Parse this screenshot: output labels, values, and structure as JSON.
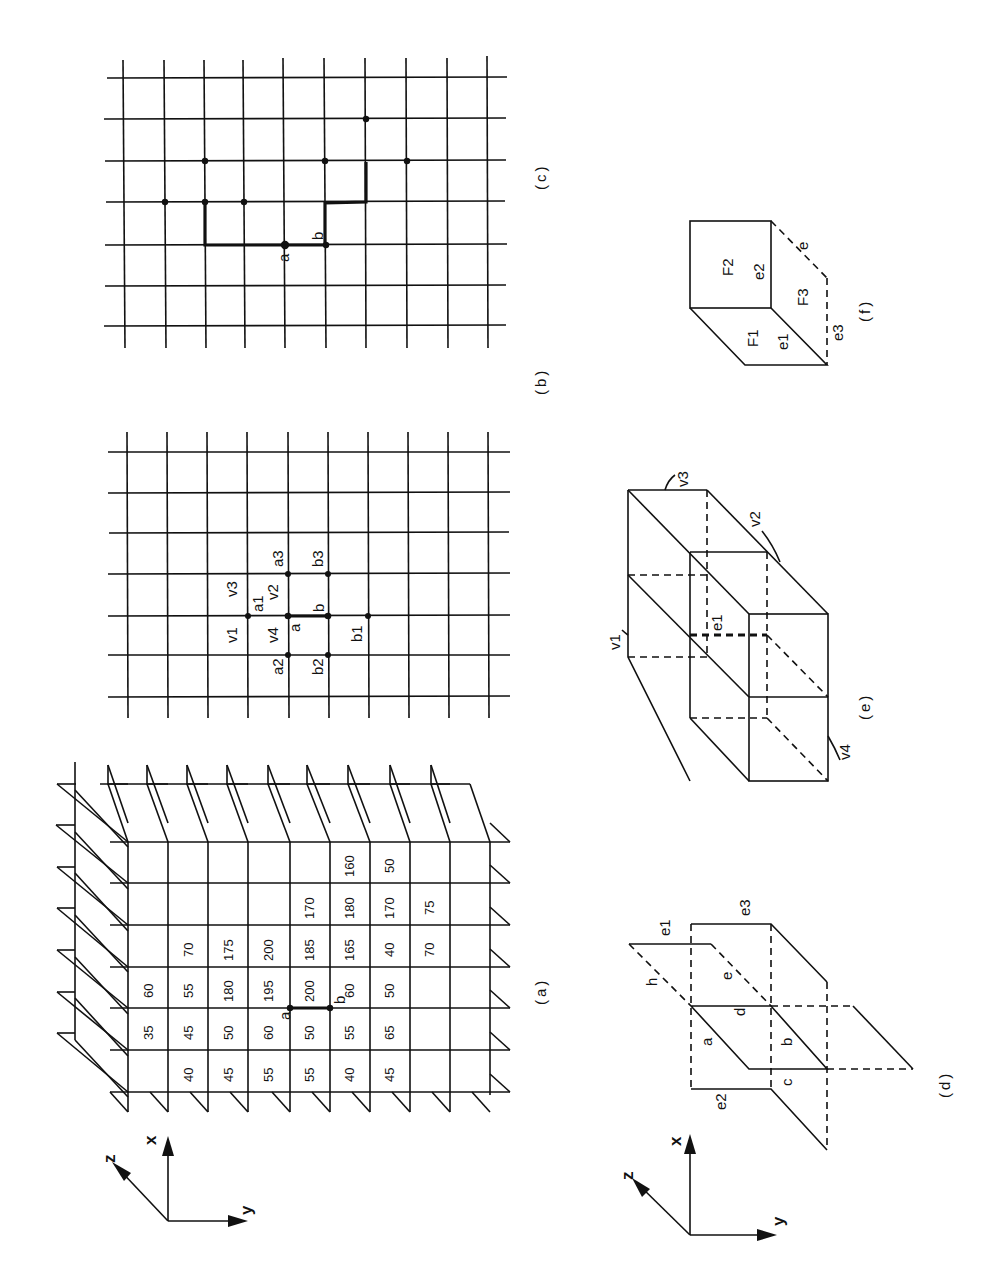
{
  "figure": {
    "orientation": "rotated-90-ccw",
    "panels": {
      "a": {
        "caption": "(a)",
        "description": "3D stack of planar grids with cell values",
        "edge_labels": [
          "a",
          "b"
        ],
        "cell_values_by_screen_column": [
          {
            "col": 1,
            "values": [
              "60",
              "35",
              ""
            ]
          },
          {
            "col": 2,
            "values": [
              "70",
              "55",
              "45",
              "40"
            ]
          },
          {
            "col": 3,
            "values": [
              "175",
              "180",
              "50",
              "45"
            ]
          },
          {
            "col": 4,
            "values": [
              "200",
              "195",
              "60",
              "55"
            ]
          },
          {
            "col": 5,
            "values": [
              "170",
              "185",
              "200",
              "50",
              "55"
            ]
          },
          {
            "col": 6,
            "values": [
              "160",
              "180",
              "165",
              "60",
              "55",
              "40"
            ]
          },
          {
            "col": 7,
            "values": [
              "50",
              "170",
              "40",
              "50",
              "65",
              "45"
            ]
          },
          {
            "col": 8,
            "values": [
              "75",
              "70"
            ]
          }
        ]
      },
      "b": {
        "caption": "(b)",
        "labels": [
          "v3",
          "a1",
          "v2",
          "a3",
          "b3",
          "v1",
          "v4",
          "a",
          "b",
          "b1",
          "a2",
          "b2"
        ]
      },
      "c": {
        "caption": "(c)",
        "labels": [
          "a",
          "b"
        ]
      },
      "d": {
        "caption": "(d)",
        "labels": [
          "e1",
          "e3",
          "h",
          "e",
          "d",
          "a",
          "b",
          "c",
          "e2"
        ]
      },
      "e": {
        "caption": "(e)",
        "labels": [
          "v3",
          "v2",
          "v1",
          "e1",
          "v4"
        ]
      },
      "f": {
        "caption": "(f)",
        "labels": [
          "F2",
          "e2",
          "e",
          "F3",
          "F1",
          "e1",
          "e3"
        ]
      }
    },
    "axes": {
      "x": "x",
      "y": "y",
      "z": "z"
    }
  }
}
